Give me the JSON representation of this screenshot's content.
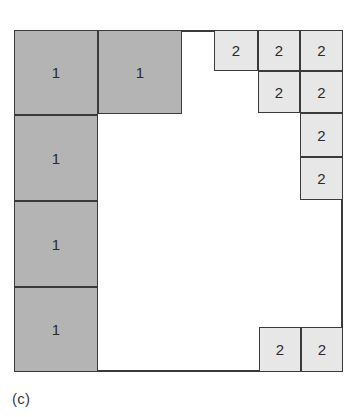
{
  "figure": {
    "caption": "(c)",
    "canvas": {
      "width": 358,
      "height": 417
    },
    "colors": {
      "background": "#ffffff",
      "stroke": "#3a3a3a",
      "type1_fill": "#b4b4b4",
      "type2_fill": "#e7e7e7",
      "label_text": "#2b2b2b"
    },
    "region": {
      "x": 14,
      "y": 30,
      "width": 329,
      "height": 342
    },
    "outline_segments": [
      {
        "name": "top-left-run",
        "x": 0,
        "y": 0,
        "width": 214,
        "height": 2
      },
      {
        "name": "left-edge",
        "x": 0,
        "y": 0,
        "width": 2,
        "height": 342
      },
      {
        "name": "bottom-run",
        "x": 0,
        "y": 340,
        "width": 329,
        "height": 2
      },
      {
        "name": "right-edge-lower",
        "x": 327,
        "y": 170,
        "width": 2,
        "height": 172
      }
    ],
    "blocks": [
      {
        "id": "b1",
        "label": "1",
        "type": "1",
        "x": 0,
        "y": 0,
        "width": 84,
        "height": 85
      },
      {
        "id": "b2",
        "label": "1",
        "type": "1",
        "x": 84,
        "y": 0,
        "width": 84,
        "height": 84
      },
      {
        "id": "b3",
        "label": "1",
        "type": "1",
        "x": 0,
        "y": 85,
        "width": 84,
        "height": 86
      },
      {
        "id": "b4",
        "label": "1",
        "type": "1",
        "x": 0,
        "y": 171,
        "width": 84,
        "height": 86
      },
      {
        "id": "b5",
        "label": "1",
        "type": "1",
        "x": 0,
        "y": 257,
        "width": 84,
        "height": 85
      },
      {
        "id": "b6",
        "label": "2",
        "type": "2",
        "x": 200,
        "y": 0,
        "width": 44,
        "height": 41
      },
      {
        "id": "b7",
        "label": "2",
        "type": "2",
        "x": 244,
        "y": 0,
        "width": 42,
        "height": 41
      },
      {
        "id": "b8",
        "label": "2",
        "type": "2",
        "x": 286,
        "y": 0,
        "width": 43,
        "height": 41
      },
      {
        "id": "b9",
        "label": "2",
        "type": "2",
        "x": 244,
        "y": 41,
        "width": 42,
        "height": 42
      },
      {
        "id": "b10",
        "label": "2",
        "type": "2",
        "x": 286,
        "y": 41,
        "width": 43,
        "height": 42
      },
      {
        "id": "b11",
        "label": "2",
        "type": "2",
        "x": 286,
        "y": 83,
        "width": 43,
        "height": 44
      },
      {
        "id": "b12",
        "label": "2",
        "type": "2",
        "x": 286,
        "y": 127,
        "width": 43,
        "height": 43
      },
      {
        "id": "b13",
        "label": "2",
        "type": "2",
        "x": 245,
        "y": 297,
        "width": 42,
        "height": 45
      },
      {
        "id": "b14",
        "label": "2",
        "type": "2",
        "x": 287,
        "y": 297,
        "width": 42,
        "height": 45
      }
    ]
  },
  "chart_data": {
    "type": "diagram",
    "title": "(c)",
    "bin": {
      "x": 14,
      "y": 30,
      "width": 329,
      "height": 342
    },
    "item_types": [
      {
        "label": "1",
        "count": 5,
        "fill": "#b4b4b4",
        "approx_size": [
          84,
          85
        ]
      },
      {
        "label": "2",
        "count": 9,
        "fill": "#e7e7e7",
        "approx_size": [
          43,
          43
        ]
      }
    ],
    "items": [
      {
        "label": "1",
        "x": 0,
        "y": 0,
        "w": 84,
        "h": 85
      },
      {
        "label": "1",
        "x": 84,
        "y": 0,
        "w": 84,
        "h": 84
      },
      {
        "label": "1",
        "x": 0,
        "y": 85,
        "w": 84,
        "h": 86
      },
      {
        "label": "1",
        "x": 0,
        "y": 171,
        "w": 84,
        "h": 86
      },
      {
        "label": "1",
        "x": 0,
        "y": 257,
        "w": 84,
        "h": 85
      },
      {
        "label": "2",
        "x": 200,
        "y": 0,
        "w": 44,
        "h": 41
      },
      {
        "label": "2",
        "x": 244,
        "y": 0,
        "w": 42,
        "h": 41
      },
      {
        "label": "2",
        "x": 286,
        "y": 0,
        "w": 43,
        "h": 41
      },
      {
        "label": "2",
        "x": 244,
        "y": 41,
        "w": 42,
        "h": 42
      },
      {
        "label": "2",
        "x": 286,
        "y": 41,
        "w": 43,
        "h": 42
      },
      {
        "label": "2",
        "x": 286,
        "y": 83,
        "w": 43,
        "h": 44
      },
      {
        "label": "2",
        "x": 286,
        "y": 127,
        "w": 43,
        "h": 43
      },
      {
        "label": "2",
        "x": 245,
        "y": 297,
        "w": 42,
        "h": 45
      },
      {
        "label": "2",
        "x": 287,
        "y": 297,
        "w": 42,
        "h": 45
      }
    ],
    "legend": [],
    "grid": false
  }
}
